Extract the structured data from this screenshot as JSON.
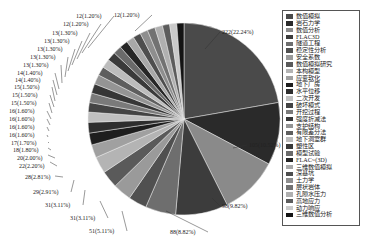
{
  "chart_data": {
    "type": "pie",
    "title": "",
    "start_angle_deg": 0,
    "direction": "clockwise",
    "legend_position": "right",
    "slices": [
      {
        "label": "数值模拟",
        "value": 222,
        "percent": "22.24%",
        "color": "#4a4a4a"
      },
      {
        "label": "岩石力学",
        "value": 105,
        "percent": "10.52%",
        "color": "#2a2a2a"
      },
      {
        "label": "数值分析",
        "value": 98,
        "percent": "9.82%",
        "color": "#8a8a8a"
      },
      {
        "label": "FLAC3D",
        "value": 88,
        "percent": "8.82%",
        "color": "#3c3c3c"
      },
      {
        "label": "隧道工程",
        "value": 51,
        "percent": "5.11%",
        "color": "#6e6e6e"
      },
      {
        "label": "稳定性分析",
        "value": 31,
        "percent": "3.11%",
        "color": "#505050"
      },
      {
        "label": "安全系数",
        "value": 31,
        "percent": "3.11%",
        "color": "#9a9a9a"
      },
      {
        "label": "数值模拟研究",
        "value": 29,
        "percent": "2.91%",
        "color": "#5a5a5a"
      },
      {
        "label": "本构模型",
        "value": 28,
        "percent": "2.81%",
        "color": "#b4b4b4"
      },
      {
        "label": "应变软化",
        "value": 22,
        "percent": "2.20%",
        "color": "#a0a0a0"
      },
      {
        "label": "地下厂房",
        "value": 20,
        "percent": "2.00%",
        "color": "#1e1e1e"
      },
      {
        "label": "水平位移",
        "value": 18,
        "percent": "1.80%",
        "color": "#2e2e2e"
      },
      {
        "label": "二次开发",
        "value": 17,
        "percent": "1.70%",
        "color": "#c0c0c0"
      },
      {
        "label": "破坏模式",
        "value": 16,
        "percent": "1.60%",
        "color": "#444444"
      },
      {
        "label": "开挖过程",
        "value": 16,
        "percent": "1.60%",
        "color": "#7a7a7a"
      },
      {
        "label": "强度折减法",
        "value": 16,
        "percent": "1.60%",
        "color": "#363636"
      },
      {
        "label": "支护结构",
        "value": 16,
        "percent": "1.60%",
        "color": "#949494"
      },
      {
        "label": "有限差分法",
        "value": 15,
        "percent": "1.50%",
        "color": "#5e5e5e"
      },
      {
        "label": "地下洞室群",
        "value": 15,
        "percent": "1.50%",
        "color": "#bcbcbc"
      },
      {
        "label": "塑性区",
        "value": 15,
        "percent": "1.50%",
        "color": "#3a3a3a"
      },
      {
        "label": "模型试验",
        "value": 14,
        "percent": "1.40%",
        "color": "#6a6a6a"
      },
      {
        "label": "FLAC~(3D)",
        "value": 14,
        "percent": "1.40%",
        "color": "#262626"
      },
      {
        "label": "三维数值模拟",
        "value": 13,
        "percent": "1.30%",
        "color": "#a8a8a8"
      },
      {
        "label": "深基坑",
        "value": 13,
        "percent": "1.30%",
        "color": "#4e4e4e"
      },
      {
        "label": "土力学",
        "value": 13,
        "percent": "1.30%",
        "color": "#8e8e8e"
      },
      {
        "label": "层状岩体",
        "value": 13,
        "percent": "1.30%",
        "color": "#727272"
      },
      {
        "label": "孔隙水压力",
        "value": 13,
        "percent": "1.30%",
        "color": "#b0b0b0"
      },
      {
        "label": "高地应力",
        "value": 12,
        "percent": "1.20%",
        "color": "#5c5c5c"
      },
      {
        "label": "动力响应",
        "value": 12,
        "percent": "1.20%",
        "color": "#cacaca"
      },
      {
        "label": "三维数值分析",
        "value": 12,
        "percent": "1.20%",
        "color": "#141414"
      }
    ],
    "data_labels": [
      {
        "text": "222(22.24%)",
        "x": 222,
        "y": 34,
        "ax": 205,
        "ay": 49
      },
      {
        "text": "105(10.52%)",
        "x": 249,
        "y": 147,
        "ax": 233,
        "ay": 148
      },
      {
        "text": "98(9.82%)",
        "x": 222,
        "y": 208,
        "ax": 212,
        "ay": 198
      },
      {
        "text": "88(8.82%)",
        "x": 170,
        "y": 234,
        "ax": 166,
        "ay": 211
      },
      {
        "text": "51(5.11%)",
        "x": 89,
        "y": 233,
        "ax": 122,
        "ay": 211
      },
      {
        "text": "31(3.11%)",
        "x": 70,
        "y": 220,
        "ax": 100,
        "ay": 201
      },
      {
        "text": "31(3.11%)",
        "x": 45,
        "y": 207,
        "ax": 85,
        "ay": 190
      },
      {
        "text": "29(2.91%)",
        "x": 33,
        "y": 194,
        "ax": 74,
        "ay": 180
      },
      {
        "text": "28(2.81%)",
        "x": 25,
        "y": 179,
        "ax": 55,
        "ay": 176
      },
      {
        "text": "22(2.20%)",
        "x": 19,
        "y": 168,
        "ax": 50,
        "ay": 162
      },
      {
        "text": "20(2.00%)",
        "x": 17,
        "y": 160,
        "ax": 48,
        "ay": 155
      },
      {
        "text": "18(1.80%)",
        "x": 13,
        "y": 152,
        "ax": 48,
        "ay": 148
      },
      {
        "text": "17(1.70%)",
        "x": 11,
        "y": 145,
        "ax": 48,
        "ay": 142
      },
      {
        "text": "16(1.60%)",
        "x": 9,
        "y": 137,
        "ax": 48,
        "ay": 137
      },
      {
        "text": "16(1.60%)",
        "x": 9,
        "y": 129,
        "ax": 49,
        "ay": 131
      },
      {
        "text": "16(1.60%)",
        "x": 9,
        "y": 121,
        "ax": 50,
        "ay": 125
      },
      {
        "text": "16(1.60%)",
        "x": 9,
        "y": 113,
        "ax": 51,
        "ay": 119
      },
      {
        "text": "15(1.50%)",
        "x": 11,
        "y": 105,
        "ax": 52,
        "ay": 113
      },
      {
        "text": "15(1.50%)",
        "x": 12,
        "y": 97,
        "ax": 54,
        "ay": 107
      },
      {
        "text": "15(1.50%)",
        "x": 14,
        "y": 89,
        "ax": 55,
        "ay": 101
      },
      {
        "text": "14(1.40%)",
        "x": 15,
        "y": 82,
        "ax": 57,
        "ay": 95
      },
      {
        "text": "14(1.40%)",
        "x": 17,
        "y": 75,
        "ax": 59,
        "ay": 89
      },
      {
        "text": "13(1.30%)",
        "x": 23,
        "y": 67,
        "ax": 62,
        "ay": 83
      },
      {
        "text": "13(1.30%)",
        "x": 30,
        "y": 59,
        "ax": 65,
        "ay": 77
      },
      {
        "text": "13(1.30%)",
        "x": 37,
        "y": 51,
        "ax": 68,
        "ay": 71
      },
      {
        "text": "13(1.30%)",
        "x": 44,
        "y": 43,
        "ax": 72,
        "ay": 65
      },
      {
        "text": "13(1.30%)",
        "x": 52,
        "y": 35,
        "ax": 77,
        "ay": 59
      },
      {
        "text": "12(1.20%)",
        "x": 63,
        "y": 26,
        "ax": 82,
        "ay": 53
      },
      {
        "text": "12(1.20%)",
        "x": 76,
        "y": 18,
        "ax": 88,
        "ay": 48
      },
      {
        "text": "12(1.20%)",
        "x": 114,
        "y": 17,
        "ax": 135,
        "ay": 31
      }
    ],
    "center": [
      184,
      119
    ],
    "radius": 96
  },
  "legend": {
    "items": [
      "数值模拟",
      "岩石力学",
      "数值分析",
      "FLAC3D",
      "隧道工程",
      "稳定性分析",
      "安全系数",
      "数值模拟研究",
      "本构模型",
      "应变软化",
      "地下厂房",
      "水平位移",
      "二次开发",
      "破坏模式",
      "开挖过程",
      "强度折减法",
      "支护结构",
      "有限差分法",
      "地下洞室群",
      "塑性区",
      "模型试验",
      "FLAC~(3D)",
      "三维数值模拟",
      "深基坑",
      "土力学",
      "层状岩体",
      "孔隙水压力",
      "高地应力",
      "动力响应",
      "三维数值分析"
    ]
  }
}
